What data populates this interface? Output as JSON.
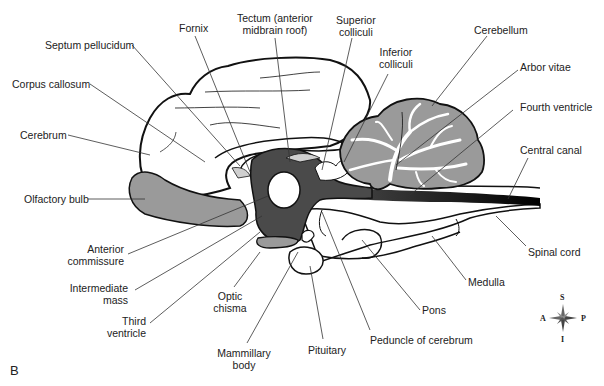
{
  "figure": {
    "panel_label": "B",
    "labels": {
      "septum_pellucidum": "Septum pellucidum",
      "fornix": "Fornix",
      "tectum_line1": "Tectum (anterior",
      "tectum_line2": "midbrain roof)",
      "superior_colliculi_1": "Superior",
      "superior_colliculi_2": "colliculi",
      "inferior_colliculi_1": "Inferior",
      "inferior_colliculi_2": "colliculi",
      "cerebellum": "Cerebellum",
      "arbor_vitae": "Arbor vitae",
      "fourth_ventricle": "Fourth ventricle",
      "central_canal": "Central canal",
      "corpus_callosum": "Corpus callosum",
      "cerebrum": "Cerebrum",
      "olfactory_bulb": "Olfactory bulb",
      "anterior_commissure_1": "Anterior",
      "anterior_commissure_2": "commissure",
      "intermediate_mass_1": "Intermediate",
      "intermediate_mass_2": "mass",
      "third_ventricle_1": "Third",
      "third_ventricle_2": "ventricle",
      "optic_chisma_1": "Optic",
      "optic_chisma_2": "chisma",
      "mammillary_body_1": "Mammillary",
      "mammillary_body_2": "body",
      "pituitary": "Pituitary",
      "peduncle": "Peduncle of cerebrum",
      "pons": "Pons",
      "medulla": "Medulla",
      "spinal_cord": "Spinal cord"
    },
    "compass": {
      "S": "S",
      "I": "I",
      "A": "A",
      "P": "P"
    },
    "colors": {
      "outline": "#111111",
      "gray_tissue": "#9a9a9a",
      "dark_ventricle": "#4a4a4a",
      "light_gray": "#cfcfcf"
    }
  }
}
